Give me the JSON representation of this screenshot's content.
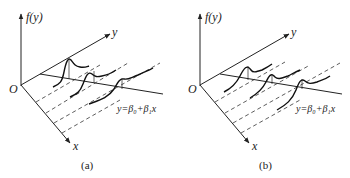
{
  "figure": {
    "panels": [
      {
        "id": "a",
        "caption": "(a)",
        "vertical_axis_label": "f(y)",
        "y_axis_label": "y",
        "x_axis_label": "x",
        "origin_label": "O",
        "regression_line_label": "y=β₀+β₁x",
        "distribution_shape": "right-skewed (peak followed by long tail toward larger y)",
        "distribution_count": 3
      },
      {
        "id": "b",
        "caption": "(b)",
        "vertical_axis_label": "f(y)",
        "y_axis_label": "y",
        "x_axis_label": "x",
        "origin_label": "O",
        "regression_line_label": "y=β₀+β₁x",
        "distribution_shape": "left-skewed (long tail from smaller y rising to peak)",
        "distribution_count": 3
      }
    ],
    "colors": {
      "ink": "#222222",
      "background": "#ffffff"
    }
  }
}
